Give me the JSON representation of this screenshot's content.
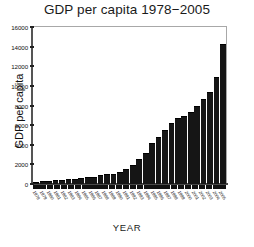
{
  "chart_data": {
    "type": "bar",
    "title": "GDP per capita 1978−2005",
    "xlabel": "YEAR",
    "ylabel": "GDP per capita",
    "ylim": [
      0,
      16000
    ],
    "yticks": [
      0,
      2000,
      4000,
      6000,
      8000,
      10000,
      12000,
      14000,
      16000
    ],
    "ytick_labels": [
      "0",
      "2000",
      "4000",
      "6000",
      "8000",
      "10000",
      "12000",
      "14000",
      "16000"
    ],
    "grid": false,
    "legend": null,
    "bar_color": "#151515",
    "categories": [
      "1978",
      "1979",
      "1980",
      "1981",
      "1982",
      "1983",
      "1984",
      "1985",
      "1986",
      "1987",
      "1988",
      "1989",
      "1990",
      "1991",
      "1992",
      "1993",
      "1994",
      "1995",
      "1996",
      "1997",
      "1998",
      "1999",
      "2000",
      "2001",
      "2002",
      "2003",
      "2004",
      "2005"
    ],
    "values": [
      250,
      300,
      330,
      370,
      420,
      480,
      560,
      620,
      670,
      750,
      900,
      1000,
      1050,
      1200,
      1500,
      1900,
      2550,
      3200,
      4200,
      4800,
      5500,
      6200,
      6700,
      6900,
      7350,
      7950,
      8700,
      9400
    ],
    "values_tail": [
      10950,
      14300
    ],
    "ymax_bar": 14300
  },
  "xlabel_text": "YEAR",
  "ylabel_text": "GDP per capita",
  "title_text": "GDP per capita 1978−2005"
}
